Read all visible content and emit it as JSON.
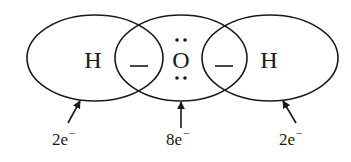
{
  "diagram": {
    "atoms": [
      {
        "symbol": "H",
        "x": 93,
        "y": 68
      },
      {
        "symbol": "O",
        "x": 181,
        "y": 68
      },
      {
        "symbol": "H",
        "x": 269,
        "y": 68
      }
    ],
    "bonds": [
      {
        "symbol": "—",
        "x": 139,
        "y": 66
      },
      {
        "symbol": "—",
        "x": 224,
        "y": 66
      }
    ],
    "shells": [
      {
        "name": "left-hydrogen-shell",
        "cx": 95,
        "cy": 58,
        "rx": 68,
        "ry": 43
      },
      {
        "name": "oxygen-shell",
        "cx": 181,
        "cy": 58,
        "rx": 66,
        "ry": 43
      },
      {
        "name": "right-hydrogen-shell",
        "cx": 270,
        "cy": 58,
        "rx": 68,
        "ry": 43
      }
    ],
    "lone_pairs": [
      {
        "position": "top",
        "dots": [
          [
            177,
            40
          ],
          [
            185,
            40
          ]
        ]
      },
      {
        "position": "bottom",
        "dots": [
          [
            177,
            78
          ],
          [
            185,
            78
          ]
        ]
      }
    ],
    "labels": [
      {
        "count": "2e",
        "charge": "−",
        "x": 52,
        "y": 145,
        "arrow": {
          "x1": 68,
          "y1": 123,
          "x2": 80,
          "y2": 101
        }
      },
      {
        "count": "8e",
        "charge": "−",
        "x": 166,
        "y": 145,
        "arrow": {
          "x1": 181,
          "y1": 128,
          "x2": 181,
          "y2": 102
        }
      },
      {
        "count": "2e",
        "charge": "−",
        "x": 279,
        "y": 145,
        "arrow": {
          "x1": 296,
          "y1": 123,
          "x2": 283,
          "y2": 101
        }
      }
    ],
    "colors": {
      "stroke": "#1a1a1a",
      "background": "#ffffff"
    }
  }
}
